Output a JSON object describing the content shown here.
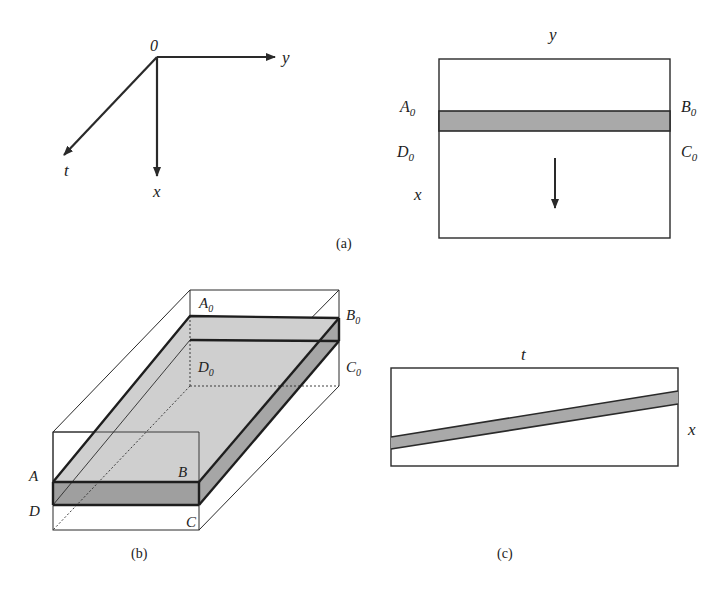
{
  "panel_a": {
    "caption": "(a)",
    "axes": {
      "origin_label": "0",
      "y_label": "y",
      "x_label": "x",
      "t_label": "t"
    },
    "plane": {
      "top_label": "y",
      "side_label": "x",
      "corner_labels": {
        "A0": "A",
        "B0": "B",
        "C0": "C",
        "D0": "D",
        "subscript": "0"
      },
      "motion_direction": "down (+x)"
    }
  },
  "panel_b": {
    "caption": "(b)",
    "labels": {
      "A0": "A",
      "B0": "B",
      "C0": "C",
      "D0": "D",
      "subscript": "0",
      "A": "A",
      "B": "B",
      "C": "C",
      "D": "D"
    }
  },
  "panel_c": {
    "caption": "(c)",
    "top_label": "t",
    "side_label": "x"
  },
  "colors": {
    "line": "#2a2a2a",
    "band_fill": "#a9a9a9",
    "top_face_fill": "#cfcfcf",
    "front_face_fill": "#9f9f9f",
    "side_face_fill": "#a6a6a6"
  }
}
